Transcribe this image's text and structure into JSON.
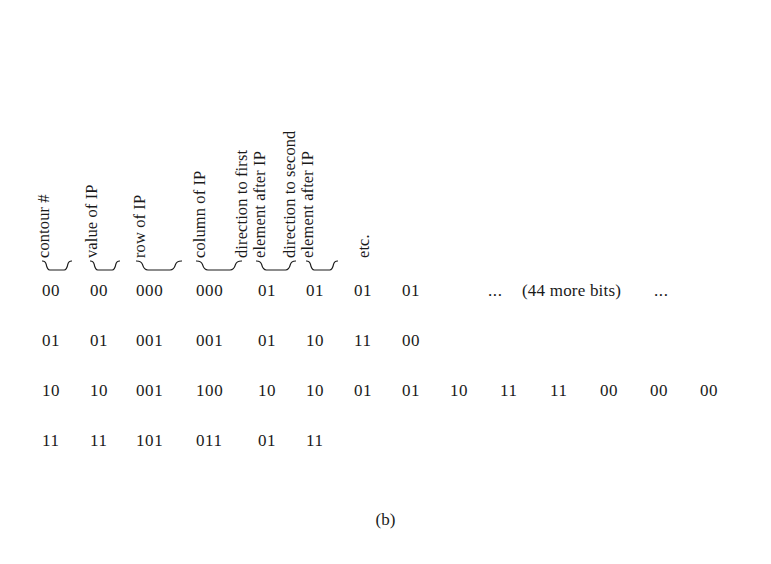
{
  "figure": {
    "caption": "(b)",
    "headers": [
      {
        "name": "contour-number",
        "line1": "contour #",
        "line2": "",
        "x": 52
      },
      {
        "name": "value-of-ip",
        "line1": "value of IP",
        "line2": "",
        "x": 100
      },
      {
        "name": "row-of-ip",
        "line1": "row of IP",
        "line2": "",
        "x": 148
      },
      {
        "name": "column-of-ip",
        "line1": "column of IP",
        "line2": "",
        "x": 208
      },
      {
        "name": "direction-to-first-element",
        "line1": "direction to first",
        "line2": "element after IP",
        "x": 268
      },
      {
        "name": "direction-to-second-element",
        "line1": "direction to second",
        "line2": "element after IP",
        "x": 316
      },
      {
        "name": "etcetera",
        "line1": "etc.",
        "line2": "",
        "x": 372
      }
    ],
    "braces": [
      {
        "name": "brace-contour-number",
        "x": 42,
        "w": 30
      },
      {
        "name": "brace-value-of-ip",
        "x": 90,
        "w": 30
      },
      {
        "name": "brace-row-of-ip",
        "x": 136,
        "w": 46
      },
      {
        "name": "brace-column-of-ip",
        "x": 196,
        "w": 46
      },
      {
        "name": "brace-direction-first",
        "x": 256,
        "w": 40
      },
      {
        "name": "brace-direction-second",
        "x": 306,
        "w": 32
      }
    ],
    "rows": [
      {
        "name": "row-contour-0",
        "cells": [
          {
            "text": "00",
            "x": 42
          },
          {
            "text": "00",
            "x": 90
          },
          {
            "text": "000",
            "x": 136
          },
          {
            "text": "000",
            "x": 196
          },
          {
            "text": "01",
            "x": 258
          },
          {
            "text": "01",
            "x": 306
          },
          {
            "text": "01",
            "x": 354
          },
          {
            "text": "01",
            "x": 402
          },
          {
            "text": "...",
            "x": 488
          },
          {
            "text": "(44 more bits)",
            "x": 522
          },
          {
            "text": "...",
            "x": 654
          }
        ]
      },
      {
        "name": "row-contour-1",
        "cells": [
          {
            "text": "01",
            "x": 42
          },
          {
            "text": "01",
            "x": 90
          },
          {
            "text": "001",
            "x": 136
          },
          {
            "text": "001",
            "x": 196
          },
          {
            "text": "01",
            "x": 258
          },
          {
            "text": "10",
            "x": 306
          },
          {
            "text": "11",
            "x": 354
          },
          {
            "text": "00",
            "x": 402
          }
        ]
      },
      {
        "name": "row-contour-2",
        "cells": [
          {
            "text": "10",
            "x": 42
          },
          {
            "text": "10",
            "x": 90
          },
          {
            "text": "001",
            "x": 136
          },
          {
            "text": "100",
            "x": 196
          },
          {
            "text": "10",
            "x": 258
          },
          {
            "text": "10",
            "x": 306
          },
          {
            "text": "01",
            "x": 354
          },
          {
            "text": "01",
            "x": 402
          },
          {
            "text": "10",
            "x": 450
          },
          {
            "text": "11",
            "x": 500
          },
          {
            "text": "11",
            "x": 550
          },
          {
            "text": "00",
            "x": 600
          },
          {
            "text": "00",
            "x": 650
          },
          {
            "text": "00",
            "x": 700
          }
        ]
      },
      {
        "name": "row-contour-3",
        "cells": [
          {
            "text": "11",
            "x": 42
          },
          {
            "text": "11",
            "x": 90
          },
          {
            "text": "101",
            "x": 136
          },
          {
            "text": "011",
            "x": 196
          },
          {
            "text": "01",
            "x": 258
          },
          {
            "text": "11",
            "x": 306
          }
        ]
      }
    ]
  }
}
